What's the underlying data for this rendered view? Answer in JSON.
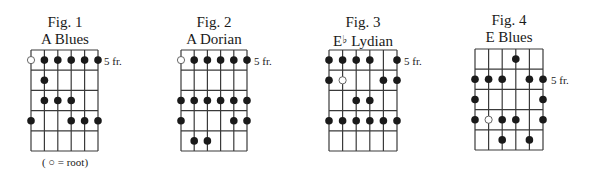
{
  "figures": [
    {
      "fig_label": "Fig. 1",
      "scale_name": "A Blues",
      "fret_label": "5 fr.",
      "fret_label_row": 1,
      "caption": "( ○ = root)",
      "grid": {
        "left": 31,
        "right": 98,
        "top": 50,
        "bottom": 151
      },
      "title_center": 65,
      "strings": 6,
      "frets": 5,
      "notes": [
        {
          "row": 1,
          "string": 1,
          "root": true
        },
        {
          "row": 1,
          "string": 2
        },
        {
          "row": 1,
          "string": 3
        },
        {
          "row": 1,
          "string": 4
        },
        {
          "row": 1,
          "string": 5
        },
        {
          "row": 1,
          "string": 6
        },
        {
          "row": 2,
          "string": 2
        },
        {
          "row": 3,
          "string": 2
        },
        {
          "row": 3,
          "string": 3
        },
        {
          "row": 3,
          "string": 4
        },
        {
          "row": 4,
          "string": 1
        },
        {
          "row": 4,
          "string": 4
        },
        {
          "row": 4,
          "string": 5
        },
        {
          "row": 4,
          "string": 6
        }
      ]
    },
    {
      "fig_label": "Fig. 2",
      "scale_name": "A Dorian",
      "fret_label": "5 fr.",
      "fret_label_row": 1,
      "grid": {
        "left": 181,
        "right": 247,
        "top": 50,
        "bottom": 151
      },
      "title_center": 214,
      "strings": 6,
      "frets": 5,
      "notes": [
        {
          "row": 1,
          "string": 1,
          "root": true
        },
        {
          "row": 1,
          "string": 2
        },
        {
          "row": 1,
          "string": 3
        },
        {
          "row": 1,
          "string": 4
        },
        {
          "row": 1,
          "string": 5
        },
        {
          "row": 1,
          "string": 6
        },
        {
          "row": 3,
          "string": 1
        },
        {
          "row": 3,
          "string": 2
        },
        {
          "row": 3,
          "string": 3
        },
        {
          "row": 3,
          "string": 4
        },
        {
          "row": 3,
          "string": 5
        },
        {
          "row": 3,
          "string": 6
        },
        {
          "row": 4,
          "string": 1
        },
        {
          "row": 4,
          "string": 5
        },
        {
          "row": 4,
          "string": 6
        },
        {
          "row": 5,
          "string": 2
        },
        {
          "row": 5,
          "string": 3
        }
      ]
    },
    {
      "fig_label": "Fig. 3",
      "scale_name_root": "E",
      "scale_name_accidental": "♭",
      "scale_name_mode": "Lydian",
      "fret_label": "5 fr.",
      "fret_label_row": 1,
      "grid": {
        "left": 329,
        "right": 397,
        "top": 50,
        "bottom": 151
      },
      "title_center": 363,
      "strings": 6,
      "frets": 5,
      "notes": [
        {
          "row": 1,
          "string": 1
        },
        {
          "row": 1,
          "string": 2
        },
        {
          "row": 1,
          "string": 3
        },
        {
          "row": 1,
          "string": 4
        },
        {
          "row": 1,
          "string": 6
        },
        {
          "row": 2,
          "string": 1
        },
        {
          "row": 2,
          "string": 2,
          "root": true
        },
        {
          "row": 2,
          "string": 5
        },
        {
          "row": 2,
          "string": 6
        },
        {
          "row": 3,
          "string": 3
        },
        {
          "row": 3,
          "string": 4
        },
        {
          "row": 4,
          "string": 1
        },
        {
          "row": 4,
          "string": 2
        },
        {
          "row": 4,
          "string": 3
        },
        {
          "row": 4,
          "string": 4
        },
        {
          "row": 4,
          "string": 5
        },
        {
          "row": 4,
          "string": 6
        }
      ]
    },
    {
      "fig_label": "Fig. 4",
      "scale_name": "E Blues",
      "fret_label": "5 fr.",
      "fret_label_row": 2,
      "grid": {
        "left": 475,
        "right": 543,
        "top": 49,
        "bottom": 150
      },
      "title_center": 509,
      "strings": 6,
      "frets": 5,
      "notes": [
        {
          "row": 1,
          "string": 4
        },
        {
          "row": 2,
          "string": 1
        },
        {
          "row": 2,
          "string": 2
        },
        {
          "row": 2,
          "string": 3
        },
        {
          "row": 2,
          "string": 5
        },
        {
          "row": 2,
          "string": 6
        },
        {
          "row": 3,
          "string": 1
        },
        {
          "row": 3,
          "string": 6
        },
        {
          "row": 4,
          "string": 1
        },
        {
          "row": 4,
          "string": 2,
          "root": true
        },
        {
          "row": 4,
          "string": 3
        },
        {
          "row": 4,
          "string": 4
        },
        {
          "row": 4,
          "string": 6
        },
        {
          "row": 5,
          "string": 3
        },
        {
          "row": 5,
          "string": 5
        }
      ]
    }
  ],
  "colors": {
    "ink": "#1a1a1a",
    "grid_line": "#3a3a3a",
    "root_fill": "#ffffff",
    "background": "#ffffff"
  }
}
